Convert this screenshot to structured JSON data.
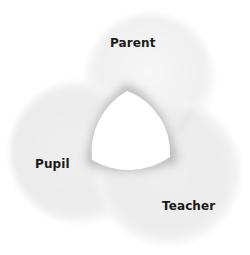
{
  "diagram": {
    "type": "venn-ring",
    "circles": [
      {
        "id": "parent",
        "label": "Parent",
        "cx": 150,
        "cy": 78,
        "r": 64
      },
      {
        "id": "pupil",
        "label": "Pupil",
        "cx": 80,
        "cy": 152,
        "r": 70
      },
      {
        "id": "teacher",
        "label": "Teacher",
        "cx": 168,
        "cy": 172,
        "r": 72
      }
    ],
    "center_region": {
      "fill": "#ffffff",
      "shape": "reuleaux-triangle"
    },
    "colors": {
      "circle_fill_light": "#f7f7f7",
      "circle_fill_mid": "#ececec",
      "circle_shadow": "#bdbdbd",
      "label": "#1a1a1a",
      "background": "#ffffff"
    }
  }
}
